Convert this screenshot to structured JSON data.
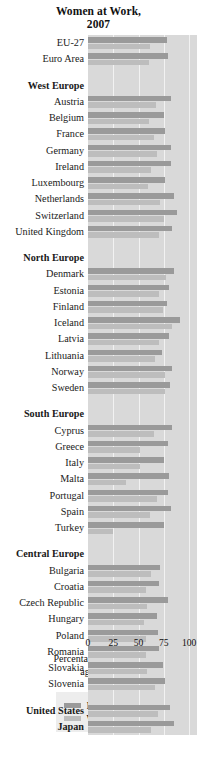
{
  "chart_data": {
    "type": "bar",
    "orientation": "horizontal",
    "title": "Women at Work, 2007",
    "title_line1": "Women at Work,",
    "title_line2": "2007",
    "xlabel_line1": "Percentage of population",
    "xlabel_line2": "aged 15–64",
    "ylabel": "",
    "xlim": [
      0,
      100
    ],
    "xticks": [
      0,
      25,
      50,
      75,
      100
    ],
    "xtick_labels": [
      "0",
      "25",
      "50",
      "75",
      "100"
    ],
    "grid": true,
    "grid_axis": "x",
    "legend_position": "bottom",
    "series": [
      {
        "name": "Men",
        "color": "#9a9a9a"
      },
      {
        "name": "Women",
        "color": "#bdbdbd"
      }
    ],
    "colors": {
      "men": "#9a9a9a",
      "women": "#bdbdbd",
      "plot_background": "#d9d9d9",
      "gridline": "#f2f2f2",
      "legend_background": "#ededed",
      "text": "#111111"
    },
    "rows": [
      {
        "label": "EU-27",
        "type": "data",
        "men": 78,
        "women": 61
      },
      {
        "label": "Euro Area",
        "type": "data",
        "men": 79,
        "women": 60
      },
      {
        "label": "",
        "type": "spacer"
      },
      {
        "label": "West Europe",
        "type": "header"
      },
      {
        "label": "Austria",
        "type": "data",
        "men": 82,
        "women": 67
      },
      {
        "label": "Belgium",
        "type": "data",
        "men": 75,
        "women": 60
      },
      {
        "label": "France",
        "type": "data",
        "men": 76,
        "women": 65
      },
      {
        "label": "Germany",
        "type": "data",
        "men": 82,
        "women": 68
      },
      {
        "label": "Ireland",
        "type": "data",
        "men": 82,
        "women": 62
      },
      {
        "label": "Luxembourg",
        "type": "data",
        "men": 76,
        "women": 59
      },
      {
        "label": "Netherlands",
        "type": "data",
        "men": 85,
        "women": 71
      },
      {
        "label": "Switzerland",
        "type": "data",
        "men": 88,
        "women": 75
      },
      {
        "label": "United Kingdom",
        "type": "data",
        "men": 83,
        "women": 70
      },
      {
        "label": "",
        "type": "spacer"
      },
      {
        "label": "North Europe",
        "type": "header"
      },
      {
        "label": "Denmark",
        "type": "data",
        "men": 85,
        "women": 77
      },
      {
        "label": "Estonia",
        "type": "data",
        "men": 80,
        "women": 70
      },
      {
        "label": "Finland",
        "type": "data",
        "men": 78,
        "women": 74
      },
      {
        "label": "Iceland",
        "type": "data",
        "men": 91,
        "women": 83
      },
      {
        "label": "Latvia",
        "type": "data",
        "men": 80,
        "women": 70
      },
      {
        "label": "Lithuania",
        "type": "data",
        "men": 73,
        "women": 66
      },
      {
        "label": "Norway",
        "type": "data",
        "men": 83,
        "women": 76
      },
      {
        "label": "Sweden",
        "type": "data",
        "men": 81,
        "women": 76
      },
      {
        "label": "",
        "type": "spacer"
      },
      {
        "label": "South Europe",
        "type": "header"
      },
      {
        "label": "Cyprus",
        "type": "data",
        "men": 83,
        "women": 65
      },
      {
        "label": "Greece",
        "type": "data",
        "men": 79,
        "women": 51
      },
      {
        "label": "Italy",
        "type": "data",
        "men": 75,
        "women": 51
      },
      {
        "label": "Malta",
        "type": "data",
        "men": 80,
        "women": 38
      },
      {
        "label": "Portugal",
        "type": "data",
        "men": 79,
        "women": 68
      },
      {
        "label": "Spain",
        "type": "data",
        "men": 82,
        "women": 61
      },
      {
        "label": "Turkey",
        "type": "data",
        "men": 75,
        "women": 25
      },
      {
        "label": "",
        "type": "spacer"
      },
      {
        "label": "Central Europe",
        "type": "header"
      },
      {
        "label": "Bulgaria",
        "type": "data",
        "men": 71,
        "women": 62
      },
      {
        "label": "Croatia",
        "type": "data",
        "men": 70,
        "women": 57
      },
      {
        "label": "Czech Republic",
        "type": "data",
        "men": 79,
        "women": 58
      },
      {
        "label": "Hungary",
        "type": "data",
        "men": 68,
        "women": 55
      },
      {
        "label": "Poland",
        "type": "data",
        "men": 69,
        "women": 57
      },
      {
        "label": "Romania",
        "type": "data",
        "men": 70,
        "women": 57
      },
      {
        "label": "Slovakia",
        "type": "data",
        "men": 74,
        "women": 58
      },
      {
        "label": "Slovenia",
        "type": "data",
        "men": 76,
        "women": 66
      },
      {
        "label": "",
        "type": "spacer"
      },
      {
        "label": "United States",
        "type": "header_data",
        "men": 81,
        "women": 69
      },
      {
        "label": "Japan",
        "type": "header_data",
        "men": 85,
        "women": 62
      }
    ]
  },
  "legend": {
    "items": [
      {
        "label": "Men",
        "key": "men"
      },
      {
        "label": "Women",
        "key": "women"
      }
    ]
  }
}
